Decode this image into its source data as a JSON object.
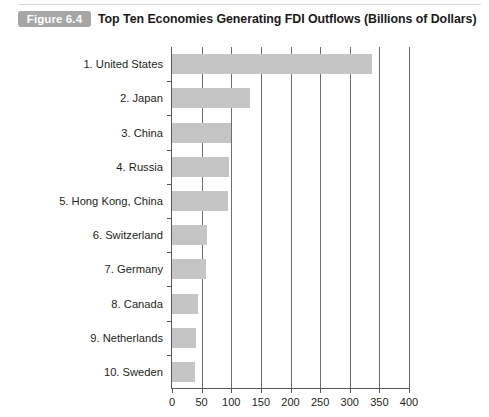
{
  "header": {
    "badge": "Figure 6.4",
    "title": "Top Ten Economies Generating FDI Outflows (Billions of Dollars)"
  },
  "colors": {
    "bar_fill": "#c5c5c5",
    "badge_bg": "#a6a6a6",
    "axis": "#58585b",
    "gridline": "#6e6e6e",
    "text": "#231f20"
  },
  "chart_data": {
    "type": "bar",
    "orientation": "horizontal",
    "title": "Top Ten Economies Generating FDI Outflows (Billions of Dollars)",
    "xlabel": "",
    "ylabel": "",
    "xlim": [
      0,
      400
    ],
    "xticks": [
      "0",
      "50",
      "100",
      "150",
      "200",
      "250",
      "300",
      "350",
      "400"
    ],
    "grid": true,
    "legend": false,
    "categories": [
      "1. United States",
      "2. Japan",
      "3. China",
      "4. Russia",
      "5. Hong Kong, China",
      "6. Switzerland",
      "7. Germany",
      "8. Canada",
      "9. Netherlands",
      "10. Sweden"
    ],
    "values": [
      338,
      131,
      100,
      96,
      95,
      59,
      58,
      44,
      41,
      39
    ]
  }
}
